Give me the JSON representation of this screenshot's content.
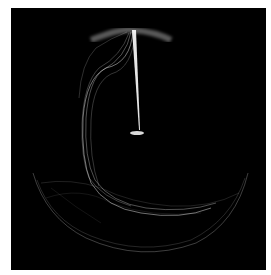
{
  "image": {
    "subject": "abstract light-trail artwork",
    "background_color": "#ffffff",
    "canvas_color": "#000000",
    "stroke_color": "#ffffff"
  }
}
